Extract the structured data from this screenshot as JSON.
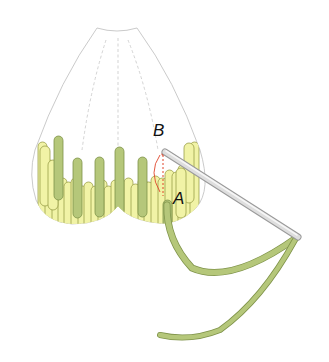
{
  "diagram": {
    "type": "embroidery-stitch-illustration",
    "labels": {
      "point_b": "B",
      "point_a": "A"
    },
    "colors": {
      "outline": "#b8b8b8",
      "light_thread": "#f1f3a6",
      "light_thread_edge": "#9aa04a",
      "dark_thread": "#b5c77a",
      "dark_thread_edge": "#7f934a",
      "needle": "#d9d9d9",
      "needle_edge": "#9a9a9a",
      "guide_line": "#e0452a"
    },
    "elements": [
      "petal-outline",
      "dashed-guide-lines",
      "long-and-short-stitches",
      "needle",
      "thread-tail",
      "stitch-path-arrow"
    ]
  }
}
